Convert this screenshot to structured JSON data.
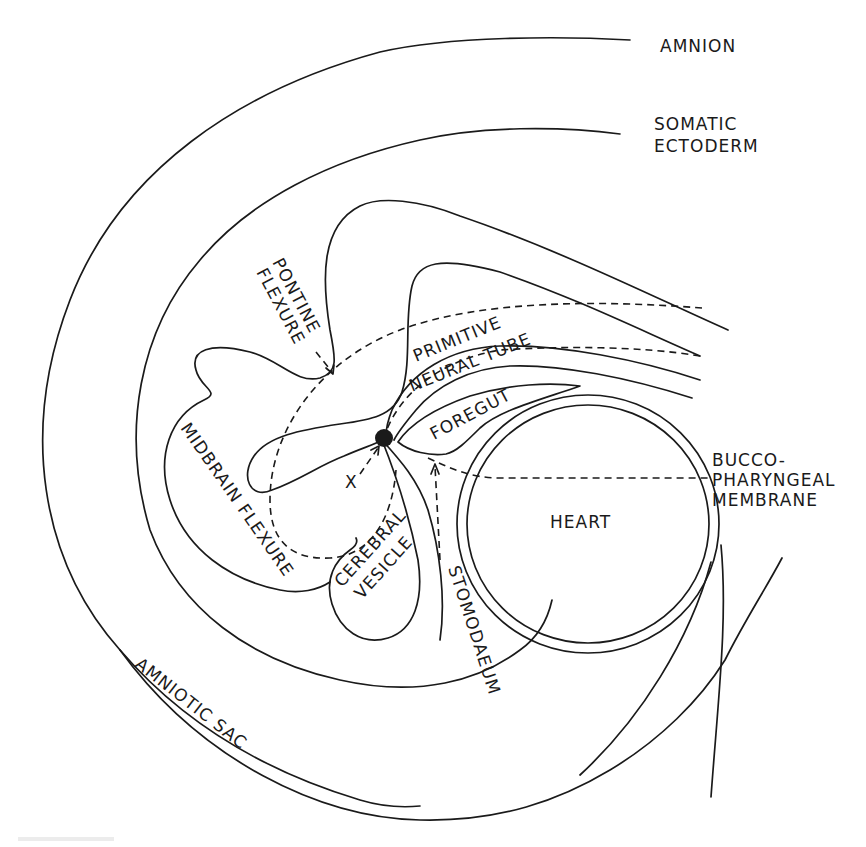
{
  "diagram": {
    "type": "embryology-sagittal-section",
    "labels": {
      "amnion": "AMNION",
      "somatic_ectoderm_1": "SOMATIC",
      "somatic_ectoderm_2": "ECTODERM",
      "pontine_flexure_1": "PONTINE",
      "pontine_flexure_2": "FLEXURE",
      "primitive_neural_tube_1": "PRIMITIVE",
      "primitive_neural_tube_2": "NEURAL TUBE",
      "foregut": "FOREGUT",
      "buccopharyngeal_1": "BUCCO-",
      "buccopharyngeal_2": "PHARYNGEAL",
      "buccopharyngeal_3": "MEMBRANE",
      "midbrain_flexure": "MIDBRAIN FLEXURE",
      "cerebral_vesicle_1": "CEREBRAL",
      "cerebral_vesicle_2": "VESICLE",
      "heart": "HEART",
      "stomodaeum": "STOMODAEUM",
      "amniotic_sac": "AMNIOTIC SAC",
      "x_marker": "X"
    },
    "colors": {
      "ink": "#1a1a1a",
      "background": "#ffffff"
    }
  }
}
